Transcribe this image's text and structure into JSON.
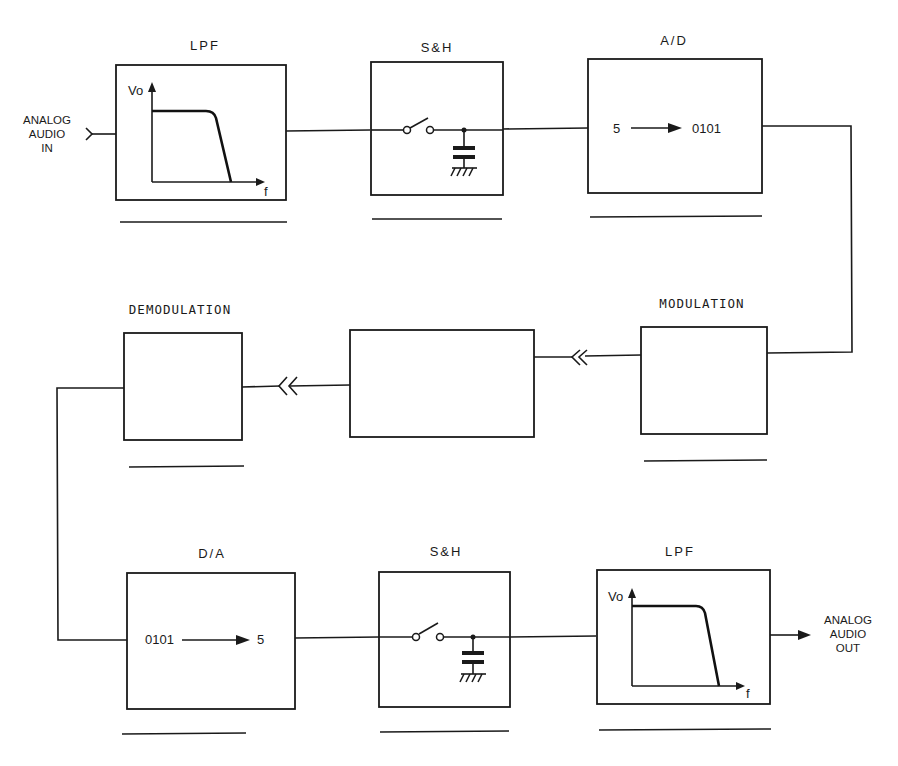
{
  "diagram": {
    "title": "",
    "io": {
      "input": {
        "lines": [
          "ANALOG",
          "AUDIO",
          "IN"
        ]
      },
      "output": {
        "lines": [
          "ANALOG",
          "AUDIO",
          "OUT"
        ]
      }
    },
    "blocks": {
      "lpf_in": {
        "label": "LPF",
        "axis_y": "Vo",
        "axis_x": "f"
      },
      "sh_in": {
        "label": "S&H"
      },
      "ad": {
        "label": "A/D",
        "from": "5",
        "to": "0101"
      },
      "modulation": {
        "label": "MODULATION"
      },
      "channel": {
        "label": ""
      },
      "demodulation": {
        "label": "DEMODULATION"
      },
      "da": {
        "label": "D/A",
        "from": "0101",
        "to": "5"
      },
      "sh_out": {
        "label": "S&H"
      },
      "lpf_out": {
        "label": "LPF",
        "axis_y": "Vo",
        "axis_x": "f"
      }
    },
    "colors": {
      "ink": "#1a1a1a",
      "paper": "#ffffff"
    }
  }
}
